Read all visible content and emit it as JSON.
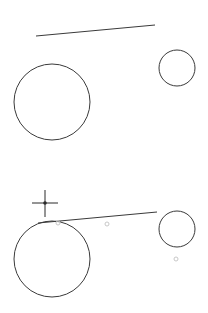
{
  "canvas": {
    "width": 208,
    "height": 313,
    "background": "#ffffff",
    "stroke_color": "#3a3a3a",
    "snap_marker_color": "#c8c8c8"
  },
  "panels": [
    {
      "name": "before",
      "line": {
        "x1": 36,
        "y1": 36,
        "x2": 155,
        "y2": 25
      },
      "circles": [
        {
          "cx": 52,
          "cy": 102,
          "r": 38
        },
        {
          "cx": 177,
          "cy": 68,
          "r": 18
        }
      ]
    },
    {
      "name": "after",
      "line": {
        "x1": 38,
        "y1": 223,
        "x2": 157,
        "y2": 212
      },
      "circles": [
        {
          "cx": 52,
          "cy": 259,
          "r": 38
        },
        {
          "cx": 177,
          "cy": 229,
          "r": 18
        }
      ],
      "cursor": {
        "x": 45,
        "y": 203,
        "type": "crosshair-icon"
      },
      "snap_markers": [
        {
          "x": 58,
          "y": 223
        },
        {
          "x": 107,
          "y": 224
        },
        {
          "x": 176,
          "y": 259
        }
      ]
    }
  ]
}
